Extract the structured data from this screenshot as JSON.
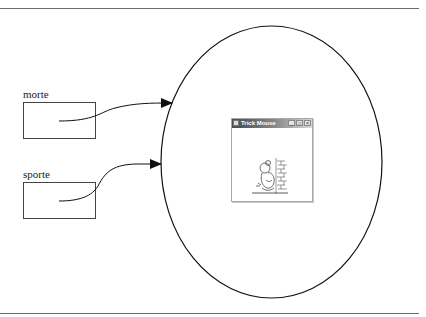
{
  "diagram": {
    "variables": [
      {
        "name": "morte",
        "box": {
          "x": 23,
          "y": 102,
          "w": 73,
          "h": 37
        },
        "label_pos": {
          "x": 23,
          "y": 88
        }
      },
      {
        "name": "sporte",
        "box": {
          "x": 23,
          "y": 182,
          "w": 73,
          "h": 37
        },
        "label_pos": {
          "x": 23,
          "y": 168
        }
      }
    ],
    "object": {
      "shape": "ellipse",
      "cx": 271.5,
      "cy": 162,
      "rx": 110.5,
      "ry": 136,
      "contains": "window-screenshot"
    },
    "references": [
      {
        "from": "morte",
        "to": "object",
        "start": [
          59,
          121
        ],
        "end": [
          172,
          103
        ]
      },
      {
        "from": "sporte",
        "to": "object",
        "start": [
          59,
          201
        ],
        "end": [
          161,
          164
        ]
      }
    ],
    "window": {
      "title": "Trick Mouse",
      "buttons": [
        "_",
        "□",
        "×"
      ],
      "content": "mouse-drawing-icon"
    },
    "colors": {
      "line": "#111111",
      "rule": "#6d6d6d",
      "background": "#ffffff"
    }
  }
}
